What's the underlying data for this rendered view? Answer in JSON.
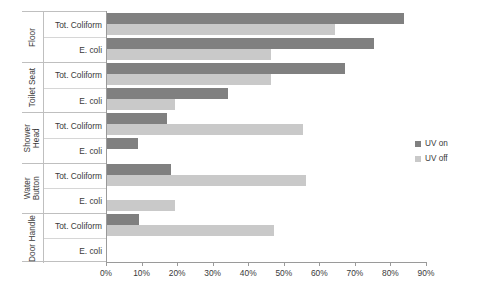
{
  "chart_data": {
    "type": "bar",
    "orientation": "horizontal",
    "title": "",
    "xlabel": "",
    "ylabel": "",
    "xlim": [
      0,
      90
    ],
    "grid": false,
    "legend_position": "right",
    "xtick_labels": [
      "0%",
      "10%",
      "20%",
      "30%",
      "40%",
      "50%",
      "60%",
      "70%",
      "80%",
      "90%"
    ],
    "xtick_values": [
      0,
      10,
      20,
      30,
      40,
      50,
      60,
      70,
      80,
      90
    ],
    "groups": [
      "Floor",
      "Toilet Seat",
      "Shower\nHead",
      "Water\nButton",
      "Door Handle"
    ],
    "subcategories": [
      "Tot. Coliform",
      "E. coli"
    ],
    "series": [
      {
        "name": "UV on",
        "color": "#808080",
        "values": [
          83.5,
          75.0,
          67.0,
          34.0,
          17.0,
          8.8,
          17.9,
          0.0,
          9.0,
          0.0
        ]
      },
      {
        "name": "UV off",
        "color": "#c9c9c9",
        "values": [
          64.0,
          46.0,
          46.0,
          19.0,
          55.0,
          0.0,
          56.0,
          19.0,
          47.0,
          0.0
        ]
      }
    ],
    "categories": [
      "Floor - Tot. Coliform",
      "Floor - E. coli",
      "Toilet Seat - Tot. Coliform",
      "Toilet Seat - E. coli",
      "Shower Head - Tot. Coliform",
      "Shower Head - E. coli",
      "Water Button - Tot. Coliform",
      "Water Button - E. coli",
      "Door Handle - Tot. Coliform",
      "Door Handle - E. coli"
    ]
  },
  "axis": {
    "categories": [
      {
        "group": "Floor",
        "group_lines": [
          "Floor"
        ],
        "rows": [
          "Tot. Coliform",
          "E. coli"
        ]
      },
      {
        "group": "Toilet Seat",
        "group_lines": [
          "Toilet Seat"
        ],
        "rows": [
          "Tot. Coliform",
          "E. coli"
        ]
      },
      {
        "group": "Shower Head",
        "group_lines": [
          "Shower",
          "Head"
        ],
        "rows": [
          "Tot. Coliform",
          "E. coli"
        ]
      },
      {
        "group": "Water Button",
        "group_lines": [
          "Water",
          "Button"
        ],
        "rows": [
          "Tot. Coliform",
          "E. coli"
        ]
      },
      {
        "group": "Door Handle",
        "group_lines": [
          "Door Handle"
        ],
        "rows": [
          "Tot. Coliform",
          "E. coli"
        ]
      }
    ],
    "labels": {
      "g0_name": "Floor",
      "g0_r0": "Tot. Coliform",
      "g0_r1": "E. coli",
      "g1_name": "Toilet Seat",
      "g1_r0": "Tot. Coliform",
      "g1_r1": "E. coli",
      "g2_name": "Shower\nHead",
      "g2_r0": "Tot. Coliform",
      "g2_r1": "E. coli",
      "g3_name": "Water\nButton",
      "g3_r0": "Tot. Coliform",
      "g3_r1": "E. coli",
      "g4_name": "Door Handle",
      "g4_r0": "Tot. Coliform",
      "g4_r1": "E. coli"
    },
    "ticks": {
      "t0": "0%",
      "t1": "10%",
      "t2": "20%",
      "t3": "30%",
      "t4": "40%",
      "t5": "50%",
      "t6": "60%",
      "t7": "70%",
      "t8": "80%",
      "t9": "90%"
    }
  },
  "legend": {
    "items": [
      {
        "label": "UV on",
        "color": "#808080"
      },
      {
        "label": "UV off",
        "color": "#c9c9c9"
      }
    ],
    "uv_on_label": "UV on",
    "uv_off_label": "UV off"
  }
}
